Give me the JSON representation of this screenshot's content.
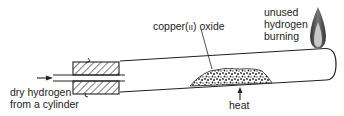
{
  "diagram": {
    "labels": {
      "copper_oxide": "copper(II) oxide",
      "copper_oxide_prefix": "copper(",
      "copper_oxide_roman": "II",
      "copper_oxide_suffix": ") oxide",
      "unused_line1": "unused",
      "unused_line2": "hydrogen",
      "unused_line3": "burning",
      "inlet_line1": "dry hydrogen",
      "inlet_line2": "from a cylinder",
      "heat": "heat"
    },
    "components": [
      "combustion tube",
      "rubber stopper (hatched)",
      "inlet tube",
      "copper(II) oxide powder",
      "flame at jet"
    ],
    "colors": {
      "line": "#222222",
      "flame_outer": "#555555",
      "flame_inner": "#bbbbbb",
      "background": "#ffffff"
    }
  }
}
